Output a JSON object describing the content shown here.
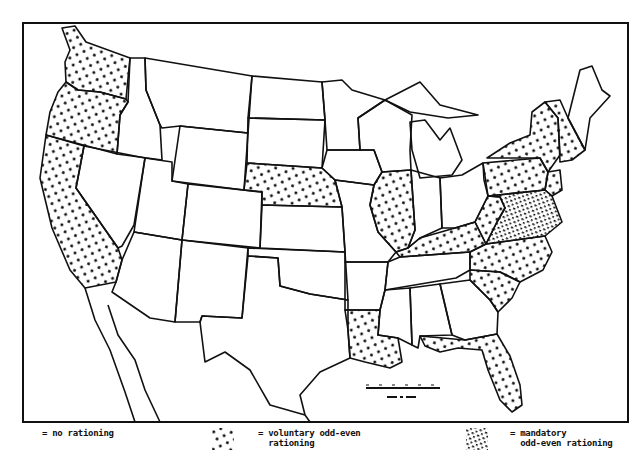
{
  "map": {
    "title": "",
    "colors": {
      "ink": "#111111",
      "paper": "#ffffff"
    },
    "frame": {
      "x": 23,
      "y": 23,
      "width": 605,
      "height": 399
    },
    "categories": {
      "none": "no rationing",
      "voluntary": "voluntary odd-even rationing",
      "mandatory": "mandatory odd-even rationing"
    },
    "states": {
      "voluntary": [
        "Washington",
        "Oregon",
        "California",
        "Nebraska",
        "Illinois",
        "Kentucky",
        "Louisiana",
        "Florida",
        "North Carolina",
        "South Carolina",
        "Pennsylvania",
        "New York",
        "Vermont",
        "New Hampshire",
        "Massachusetts",
        "Connecticut",
        "Rhode Island",
        "New Jersey",
        "West Virginia"
      ],
      "mandatory": [
        "Virginia",
        "Maryland",
        "Delaware",
        "District of Columbia"
      ],
      "none": [
        "Idaho",
        "Montana",
        "Wyoming",
        "Nevada",
        "Utah",
        "Colorado",
        "Arizona",
        "New Mexico",
        "North Dakota",
        "South Dakota",
        "Kansas",
        "Oklahoma",
        "Texas",
        "Minnesota",
        "Iowa",
        "Missouri",
        "Arkansas",
        "Wisconsin",
        "Michigan",
        "Indiana",
        "Ohio",
        "Tennessee",
        "Mississippi",
        "Alabama",
        "Georgia",
        "Maine"
      ]
    },
    "scale_bar": {
      "label": "SCALE IN MILES"
    }
  },
  "legend": [
    {
      "key": "none",
      "line1": "= no rationing",
      "line2": ""
    },
    {
      "key": "voluntary",
      "line1": "= voluntary odd-even",
      "line2": "  rationing"
    },
    {
      "key": "mandatory",
      "line1": "= mandatory",
      "line2": "  odd-even rationing"
    }
  ]
}
